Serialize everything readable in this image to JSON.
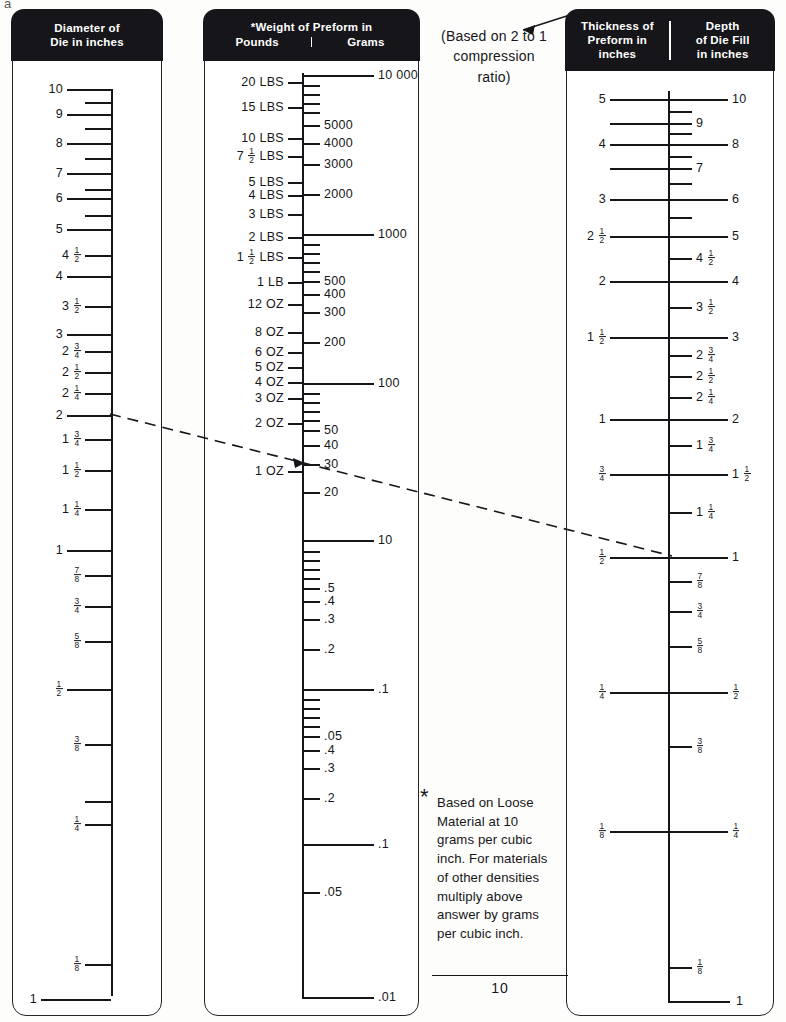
{
  "title_fragment": "a",
  "panels": {
    "die_diameter": {
      "header_lines": [
        "Diameter of",
        "Die in inches"
      ],
      "bottom_mark": "1"
    },
    "weight": {
      "header_line1": "*Weight of Preform in",
      "header_left": "Pounds",
      "header_right": "Grams"
    },
    "thickness_depth": {
      "header_left_lines": [
        "Thickness of",
        "Preform in",
        "inches"
      ],
      "header_right_lines": [
        "Depth",
        "of Die Fill",
        "in inches"
      ],
      "bottom_mark": "1"
    }
  },
  "annotations": {
    "compression_note": [
      "(Based on 2 to 1",
      "compression",
      "ratio)"
    ],
    "footnote_star": "*",
    "footnote_lines": [
      "Based on Loose",
      "Material at 10",
      "grams per cubic",
      "inch. For materials",
      "of other densities",
      "multiply above",
      "answer by grams",
      "per cubic inch."
    ],
    "footnote_denominator": "10"
  },
  "chart_data": {
    "type": "nomograph",
    "isopleth": {
      "label": "dashed index line",
      "points": [
        {
          "scale": "die_diameter",
          "value": "2"
        },
        {
          "scale": "weight_grams",
          "value": "30"
        },
        {
          "scale": "thickness_inches",
          "value": "1/2"
        },
        {
          "scale": "depth_of_die_fill",
          "value": "1"
        }
      ]
    },
    "scales": [
      {
        "name": "die_diameter",
        "axis_label": "Diameter of Die in inches",
        "side": "left",
        "ticks": [
          {
            "v": "10",
            "major": true,
            "y": 88
          },
          {
            "v": "",
            "major": false,
            "y": 101
          },
          {
            "v": "9",
            "major": true,
            "y": 113
          },
          {
            "v": "",
            "major": false,
            "y": 127
          },
          {
            "v": "8",
            "major": true,
            "y": 142
          },
          {
            "v": "",
            "major": false,
            "y": 157
          },
          {
            "v": "7",
            "major": true,
            "y": 172
          },
          {
            "v": "",
            "major": false,
            "y": 188
          },
          {
            "v": "6",
            "major": true,
            "y": 197
          },
          {
            "v": "",
            "major": false,
            "y": 214
          },
          {
            "v": "5",
            "major": true,
            "y": 228
          },
          {
            "v": "4 1/2",
            "major": false,
            "y": 254
          },
          {
            "v": "4",
            "major": true,
            "y": 275
          },
          {
            "v": "3 1/2",
            "major": false,
            "y": 305
          },
          {
            "v": "3",
            "major": true,
            "y": 333
          },
          {
            "v": "2 3/4",
            "major": false,
            "y": 350
          },
          {
            "v": "2 1/2",
            "major": false,
            "y": 371
          },
          {
            "v": "2 1/4",
            "major": false,
            "y": 392
          },
          {
            "v": "2",
            "major": true,
            "y": 414
          },
          {
            "v": "1 3/4",
            "major": false,
            "y": 438
          },
          {
            "v": "1 1/2",
            "major": false,
            "y": 469
          },
          {
            "v": "1 1/4",
            "major": false,
            "y": 508
          },
          {
            "v": "1",
            "major": true,
            "y": 549
          },
          {
            "v": "7/8",
            "major": false,
            "y": 574
          },
          {
            "v": "3/4",
            "major": false,
            "y": 605
          },
          {
            "v": "5/8",
            "major": false,
            "y": 640
          },
          {
            "v": "1/2",
            "major": true,
            "y": 688
          },
          {
            "v": "3/8",
            "major": false,
            "y": 743
          },
          {
            "v": "",
            "major": false,
            "y": 800
          },
          {
            "v": "1/4",
            "major": false,
            "y": 823
          },
          {
            "v": "1/8",
            "major": false,
            "y": 963
          }
        ]
      },
      {
        "name": "weight_pounds",
        "axis_label": "Weight of Preform in Pounds",
        "side": "left",
        "ticks": [
          {
            "v": "20 LBS",
            "y": 81
          },
          {
            "v": "15 LBS",
            "y": 106
          },
          {
            "v": "10 LBS",
            "y": 137
          },
          {
            "v": "7 1/2 LBS",
            "y": 155
          },
          {
            "v": "5 LBS",
            "y": 181
          },
          {
            "v": "4 LBS",
            "y": 194
          },
          {
            "v": "3 LBS",
            "y": 213
          },
          {
            "v": "2 LBS",
            "y": 236
          },
          {
            "v": "1 1/2 LBS",
            "y": 256
          },
          {
            "v": "1 LB",
            "y": 281
          },
          {
            "v": "12 OZ",
            "y": 303
          },
          {
            "v": "8 OZ",
            "y": 331
          },
          {
            "v": "6 OZ",
            "y": 351
          },
          {
            "v": "5 OZ",
            "y": 366
          },
          {
            "v": "4 OZ",
            "y": 381
          },
          {
            "v": "3 OZ",
            "y": 397
          },
          {
            "v": "2 OZ",
            "y": 422
          },
          {
            "v": "1 OZ",
            "y": 470
          }
        ]
      },
      {
        "name": "weight_grams",
        "axis_label": "Weight of Preform in Grams",
        "side": "right",
        "ticks": [
          {
            "v": "10 000",
            "major": true,
            "y": 74
          },
          {
            "v": "",
            "major": false,
            "y": 84
          },
          {
            "v": "",
            "major": false,
            "y": 93
          },
          {
            "v": "",
            "major": false,
            "y": 102
          },
          {
            "v": "",
            "major": false,
            "y": 111
          },
          {
            "v": "5000",
            "major": false,
            "y": 124
          },
          {
            "v": "4000",
            "major": false,
            "y": 142
          },
          {
            "v": "3000",
            "major": false,
            "y": 163
          },
          {
            "v": "2000",
            "major": false,
            "y": 193
          },
          {
            "v": "1000",
            "major": true,
            "y": 233
          },
          {
            "v": "",
            "major": false,
            "y": 243
          },
          {
            "v": "",
            "major": false,
            "y": 252
          },
          {
            "v": "",
            "major": false,
            "y": 261
          },
          {
            "v": "",
            "major": false,
            "y": 270
          },
          {
            "v": "500",
            "major": false,
            "y": 280
          },
          {
            "v": "400",
            "major": false,
            "y": 293
          },
          {
            "v": "300",
            "major": false,
            "y": 311
          },
          {
            "v": "200",
            "major": false,
            "y": 341
          },
          {
            "v": "100",
            "major": true,
            "y": 382
          },
          {
            "v": "",
            "major": false,
            "y": 392
          },
          {
            "v": "",
            "major": false,
            "y": 401
          },
          {
            "v": "",
            "major": false,
            "y": 410
          },
          {
            "v": "",
            "major": false,
            "y": 419
          },
          {
            "v": "50",
            "major": false,
            "y": 429
          },
          {
            "v": "40",
            "major": false,
            "y": 444
          },
          {
            "v": "30",
            "major": false,
            "y": 463
          },
          {
            "v": "20",
            "major": false,
            "y": 491
          },
          {
            "v": "10",
            "major": true,
            "y": 539
          },
          {
            "v": "",
            "major": false,
            "y": 550
          },
          {
            "v": "",
            "major": false,
            "y": 559
          },
          {
            "v": "",
            "major": false,
            "y": 568
          },
          {
            "v": "",
            "major": false,
            "y": 577
          },
          {
            "v": ".5",
            "major": false,
            "y": 587
          },
          {
            "v": ".4",
            "major": false,
            "y": 600
          },
          {
            "v": ".3",
            "major": false,
            "y": 618
          },
          {
            "v": ".2",
            "major": false,
            "y": 648
          },
          {
            "v": ".1",
            "major": true,
            "y": 688
          },
          {
            "v": "",
            "major": false,
            "y": 698
          },
          {
            "v": "",
            "major": false,
            "y": 707
          },
          {
            "v": "",
            "major": false,
            "y": 716
          },
          {
            "v": "",
            "major": false,
            "y": 725
          },
          {
            "v": ".05",
            "major": false,
            "y": 735
          },
          {
            "v": ".4",
            "major": false,
            "y": 749
          },
          {
            "v": ".3",
            "major": false,
            "y": 767
          },
          {
            "v": ".2",
            "major": false,
            "y": 797
          },
          {
            "v": ".1",
            "major": true,
            "y": 843
          },
          {
            "v": ".05",
            "major": false,
            "y": 891
          },
          {
            "v": ".01",
            "major": true,
            "y": 996
          }
        ]
      },
      {
        "name": "thickness_inches",
        "axis_label": "Thickness of Preform in inches",
        "side": "left",
        "ticks": [
          {
            "v": "5",
            "y": 98
          },
          {
            "v": "",
            "y": 122
          },
          {
            "v": "4",
            "y": 143
          },
          {
            "v": "",
            "y": 167
          },
          {
            "v": "3",
            "y": 198
          },
          {
            "v": "2 1/2",
            "y": 235
          },
          {
            "v": "2",
            "y": 280
          },
          {
            "v": "1 1/2",
            "y": 336
          },
          {
            "v": "1",
            "y": 418
          },
          {
            "v": "3/4",
            "y": 473
          },
          {
            "v": "1/2",
            "y": 556
          },
          {
            "v": "1/4",
            "y": 691
          },
          {
            "v": "1/8",
            "y": 830
          }
        ]
      },
      {
        "name": "depth_of_die_fill",
        "axis_label": "Depth of Die Fill in inches",
        "side": "right",
        "ticks": [
          {
            "v": "10",
            "y": 98
          },
          {
            "v": "",
            "y": 110
          },
          {
            "v": "9",
            "y": 122
          },
          {
            "v": "",
            "y": 132
          },
          {
            "v": "8",
            "y": 143
          },
          {
            "v": "",
            "y": 155
          },
          {
            "v": "7",
            "y": 167
          },
          {
            "v": "",
            "y": 182
          },
          {
            "v": "6",
            "y": 198
          },
          {
            "v": "",
            "y": 216
          },
          {
            "v": "5",
            "y": 235
          },
          {
            "v": "4 1/2",
            "y": 257
          },
          {
            "v": "4",
            "y": 280
          },
          {
            "v": "3 1/2",
            "y": 306
          },
          {
            "v": "3",
            "y": 336
          },
          {
            "v": "2 3/4",
            "y": 354
          },
          {
            "v": "2 1/2",
            "y": 375
          },
          {
            "v": "2 1/4",
            "y": 396
          },
          {
            "v": "2",
            "y": 418
          },
          {
            "v": "1 3/4",
            "y": 444
          },
          {
            "v": "1 1/2",
            "y": 473
          },
          {
            "v": "1 1/4",
            "y": 511
          },
          {
            "v": "1",
            "y": 556
          },
          {
            "v": "7/8",
            "y": 580
          },
          {
            "v": "3/4",
            "y": 610
          },
          {
            "v": "5/8",
            "y": 645
          },
          {
            "v": "1/2",
            "y": 691
          },
          {
            "v": "3/8",
            "y": 745
          },
          {
            "v": "1/4",
            "y": 830
          },
          {
            "v": "1/8",
            "y": 966
          }
        ]
      }
    ]
  }
}
